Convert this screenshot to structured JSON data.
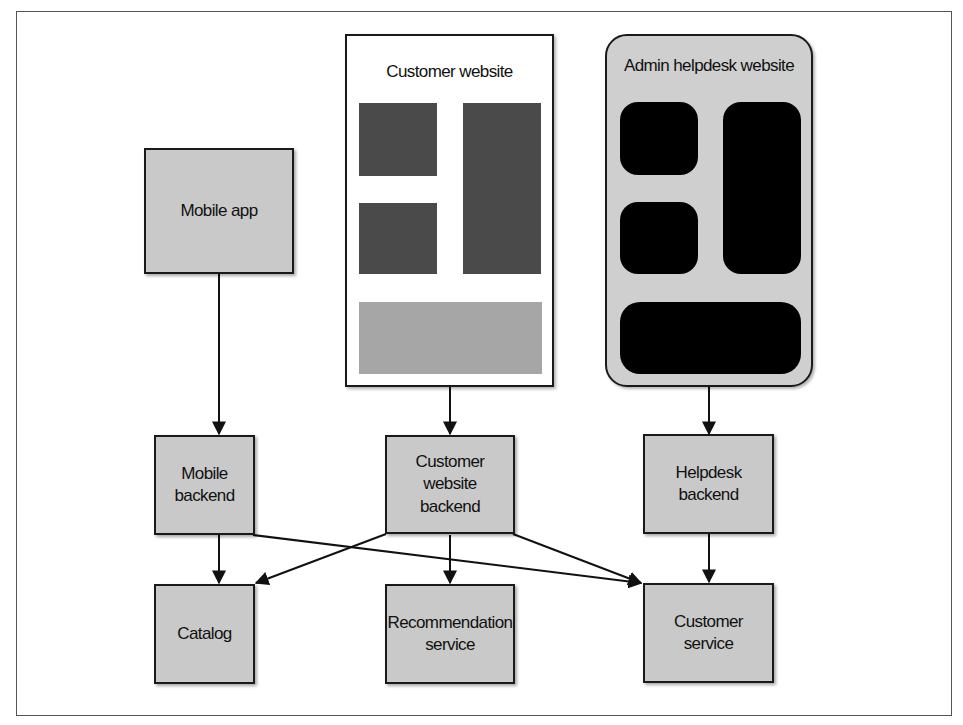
{
  "diagram": {
    "nodes": {
      "mobile_app": {
        "label": "Mobile app"
      },
      "customer_website": {
        "label": "Customer website"
      },
      "admin_helpdesk_website": {
        "label": "Admin helpdesk website"
      },
      "mobile_backend": {
        "label": "Mobile backend"
      },
      "customer_website_backend": {
        "label": "Customer\nwebsite\nbackend"
      },
      "helpdesk_backend": {
        "label": "Helpdesk\nbackend"
      },
      "catalog": {
        "label": "Catalog"
      },
      "recommendation_service": {
        "label": "Recommendation\nservice"
      },
      "customer_service": {
        "label": "Customer\nservice"
      }
    },
    "edges": [
      {
        "from": "Mobile app",
        "to": "Mobile backend"
      },
      {
        "from": "Customer website",
        "to": "Customer website backend"
      },
      {
        "from": "Admin helpdesk website",
        "to": "Helpdesk backend"
      },
      {
        "from": "Mobile backend",
        "to": "Catalog"
      },
      {
        "from": "Mobile backend",
        "to": "Customer service"
      },
      {
        "from": "Customer website backend",
        "to": "Catalog"
      },
      {
        "from": "Customer website backend",
        "to": "Recommendation service"
      },
      {
        "from": "Customer website backend",
        "to": "Customer service"
      },
      {
        "from": "Helpdesk backend",
        "to": "Customer service"
      }
    ],
    "colors": {
      "node_fill": "#c9c9c9",
      "border": "#1a1a1a",
      "website_block_dark": "#4a4a4a",
      "website_block_light": "#a6a6a6",
      "admin_block": "#000000",
      "admin_bg": "#cfcfcf"
    }
  }
}
